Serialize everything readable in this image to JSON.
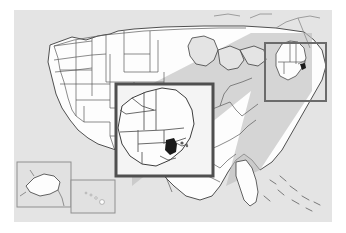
{
  "figure": {
    "type": "locator-map-with-magnified-inset",
    "background_color": "#ffffff",
    "frame": {
      "x": 14,
      "y": 10,
      "width": 318,
      "height": 212
    }
  },
  "map": {
    "name": "united-states-map",
    "projection_note": "conterminous United States with Alaska and Hawaii insets",
    "ocean_color": "#e4e4e4",
    "land_color": "#fdfdfd",
    "land_shaded_color": "#c9c9c9",
    "state_border_color": "#5a5a5a",
    "coast_border_color": "#3d3d3d",
    "highlight_color": "#1a1a1a"
  },
  "callout": {
    "name": "zoom-callout",
    "wedge_color": "#bdbdbd",
    "wedge_opacity": 0.62,
    "description": "shaded wedge connecting the small locator box to the enlarged detail box"
  },
  "locator_box": {
    "name": "locator-box-new-england",
    "label": "New England locator",
    "border_color": "#6b6b6b",
    "border_width": 2,
    "x": 251,
    "y": 33,
    "width": 61,
    "height": 58
  },
  "detail_box": {
    "name": "detail-box-new-england-magnified",
    "label": "New England magnified detail",
    "border_color": "#4f4f4f",
    "border_width": 3,
    "x": 116,
    "y": 84,
    "width": 97,
    "height": 92
  },
  "insets": [
    {
      "name": "alaska-inset",
      "label": "Alaska",
      "x": 3,
      "y": 152,
      "width": 54,
      "height": 45
    },
    {
      "name": "hawaii-inset",
      "label": "Hawaii",
      "x": 57,
      "y": 170,
      "width": 44,
      "height": 33
    }
  ],
  "highlighted_state": {
    "name": "highlighted-state",
    "label": "Rhode Island",
    "color": "#1a1a1a"
  }
}
